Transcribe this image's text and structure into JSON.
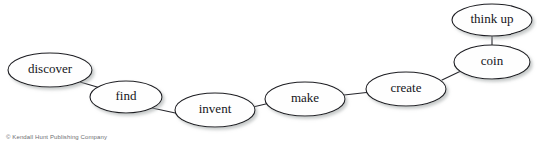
{
  "figure": {
    "background_color": "#ffffff",
    "node_fill": "#fefefe",
    "node_stroke": "#1d1d22",
    "edge_stroke": "#26262c",
    "shadow_color": "#b8bcbc",
    "label_color": "#15151a"
  },
  "top_partial_text": "",
  "nodes": [
    {
      "id": "discover",
      "label": "discover",
      "cx": 50,
      "cy": 70,
      "rx": 42,
      "ry": 17,
      "font_size": 13
    },
    {
      "id": "find",
      "label": "find",
      "cx": 126,
      "cy": 97,
      "rx": 36,
      "ry": 16,
      "font_size": 13
    },
    {
      "id": "invent",
      "label": "invent",
      "cx": 215,
      "cy": 110,
      "rx": 40,
      "ry": 17,
      "font_size": 13
    },
    {
      "id": "make",
      "label": "make",
      "cx": 305,
      "cy": 99,
      "rx": 40,
      "ry": 17,
      "font_size": 13
    },
    {
      "id": "create",
      "label": "create",
      "cx": 406,
      "cy": 89,
      "rx": 40,
      "ry": 17,
      "font_size": 13
    },
    {
      "id": "coin",
      "label": "coin",
      "cx": 492,
      "cy": 62,
      "rx": 38,
      "ry": 17,
      "font_size": 13
    },
    {
      "id": "think_up",
      "label": "think up",
      "cx": 492,
      "cy": 20,
      "rx": 40,
      "ry": 16,
      "font_size": 13
    }
  ],
  "edges": [
    {
      "id": "discover-find",
      "from": "discover",
      "to": "find",
      "x1": 80,
      "y1": 82,
      "x2": 104,
      "y2": 89
    },
    {
      "id": "find-invent",
      "from": "find",
      "to": "invent",
      "x1": 152,
      "y1": 108,
      "x2": 180,
      "y2": 114
    },
    {
      "id": "invent-make",
      "from": "invent",
      "to": "make",
      "x1": 253,
      "y1": 107,
      "x2": 270,
      "y2": 103
    },
    {
      "id": "make-create",
      "from": "make",
      "to": "create",
      "x1": 344,
      "y1": 95,
      "x2": 371,
      "y2": 92
    },
    {
      "id": "create-coin",
      "from": "create",
      "to": "coin",
      "x1": 442,
      "y1": 80,
      "x2": 463,
      "y2": 70
    },
    {
      "id": "coin-think-up",
      "from": "coin",
      "to": "think_up",
      "x1": 492,
      "y1": 45,
      "x2": 492,
      "y2": 36
    }
  ],
  "copyright": "© Kendall Hunt Publishing Company"
}
